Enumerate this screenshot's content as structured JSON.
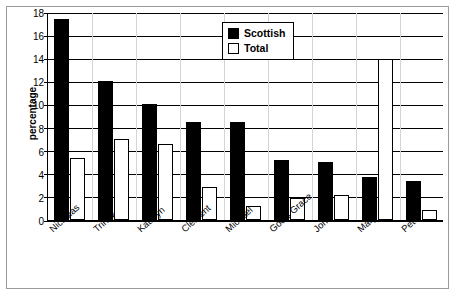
{
  "chart_data": {
    "type": "bar",
    "title": "",
    "xlabel": "",
    "ylabel": "percentage",
    "ylim": [
      0,
      18
    ],
    "yticks": [
      0,
      2,
      4,
      6,
      8,
      10,
      12,
      14,
      16,
      18
    ],
    "ytick_labels": [
      "0",
      "2",
      "4",
      "6",
      "8",
      "10",
      "12",
      "14",
      "16",
      "18"
    ],
    "grid": true,
    "legend_position": "top-center",
    "categories": [
      "Nicholas",
      "Trinity",
      "Kathryn",
      "Clement",
      "Michael",
      "God's Grace",
      "John",
      "Mary",
      "Peter"
    ],
    "series": [
      {
        "name": "Scottish",
        "color": "#000000",
        "values": [
          17.4,
          12.0,
          10.0,
          8.5,
          8.5,
          5.2,
          5.0,
          3.7,
          3.4
        ]
      },
      {
        "name": "Total",
        "color": "#ffffff",
        "values": [
          5.4,
          7.0,
          6.6,
          2.9,
          1.2,
          1.9,
          2.2,
          13.9,
          0.9
        ]
      }
    ]
  },
  "axis": {
    "y_title": "percentage"
  },
  "legend": {
    "items": [
      {
        "label": "Scottish",
        "color": "#000000"
      },
      {
        "label": "Total",
        "color": "#ffffff"
      }
    ]
  }
}
